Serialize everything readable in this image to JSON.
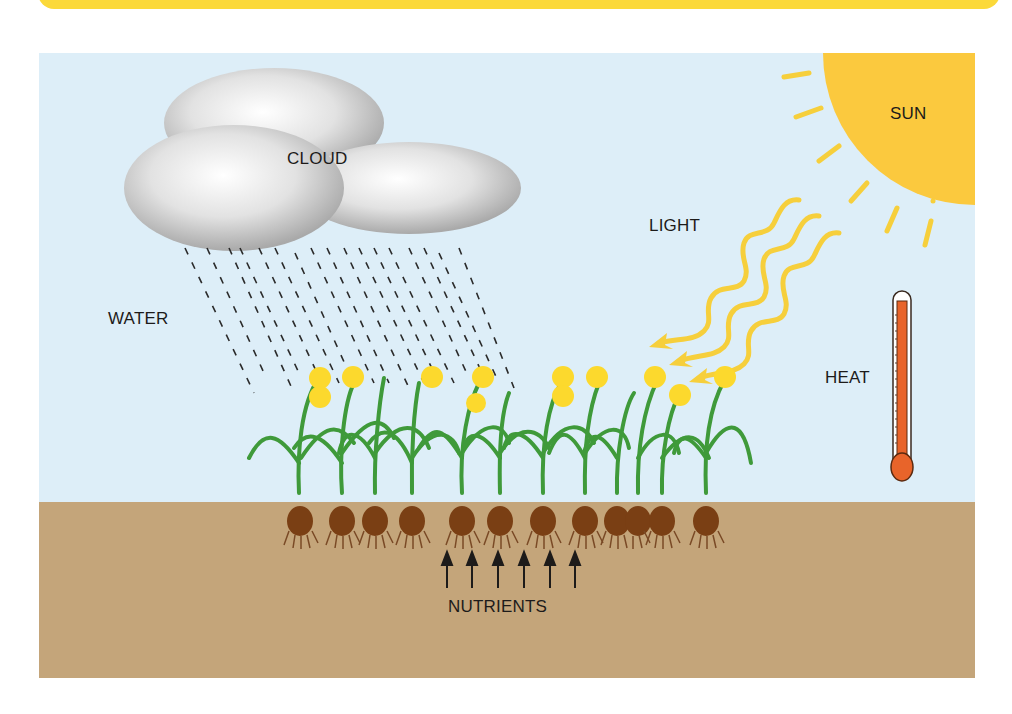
{
  "banner": {
    "color": "#fbd93a"
  },
  "labels": {
    "cloud": "CLOUD",
    "sun": "SUN",
    "light": "LIGHT",
    "water": "WATER",
    "heat": "HEAT",
    "nutrients": "NUTRIENTS"
  },
  "colors": {
    "sky": "#ddeef8",
    "soil": "#c4a57a",
    "sun": "#fbc93e",
    "light_wave": "#f6cf3c",
    "leaf": "#3f9a3a",
    "flower": "#fcd92d",
    "bulb": "#7a3f14",
    "thermometer_fluid": "#e8642a",
    "text": "#1d1b1a"
  },
  "elements": {
    "plants_count": 12,
    "flowers_count": 12,
    "nutrient_arrows_count": 6,
    "light_waves_count": 3,
    "sun_rays_count": 7
  }
}
